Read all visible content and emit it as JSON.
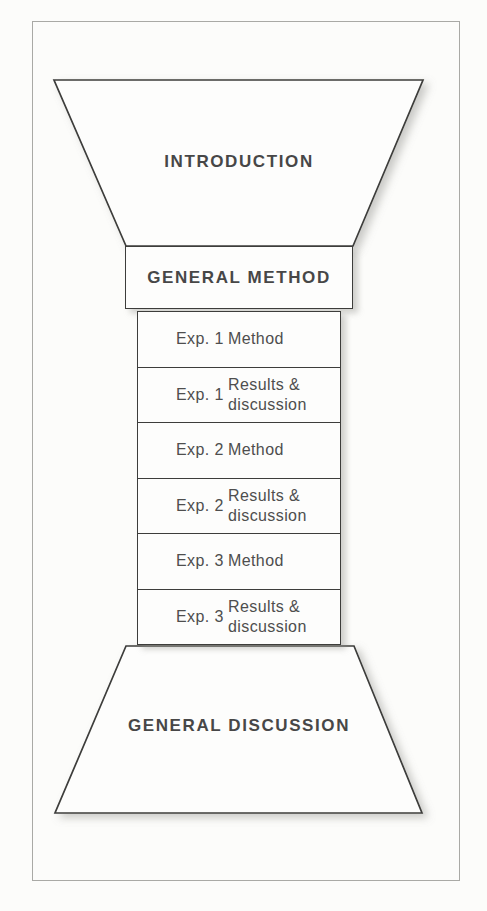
{
  "figure": {
    "introduction": {
      "label": "INTRODUCTION"
    },
    "general_method": {
      "label": "GENERAL METHOD"
    },
    "experiment_rows": [
      {
        "exp": "Exp. 1",
        "desc": "Method"
      },
      {
        "exp": "Exp. 1",
        "desc": "Results &\ndiscussion"
      },
      {
        "exp": "Exp. 2",
        "desc": "Method"
      },
      {
        "exp": "Exp. 2",
        "desc": "Results &\ndiscussion"
      },
      {
        "exp": "Exp. 3",
        "desc": "Method"
      },
      {
        "exp": "Exp. 3",
        "desc": "Results &\ndiscussion"
      }
    ],
    "general_discussion": {
      "label": "GENERAL DISCUSSION"
    }
  },
  "colors": {
    "shape_line": "#3d3d3b",
    "heading_text": "#474747",
    "row_text": "#4e4e4e",
    "frame_border": "#a9a9a5",
    "background": "#fcfcfa",
    "shadow": "#8c8c88"
  }
}
